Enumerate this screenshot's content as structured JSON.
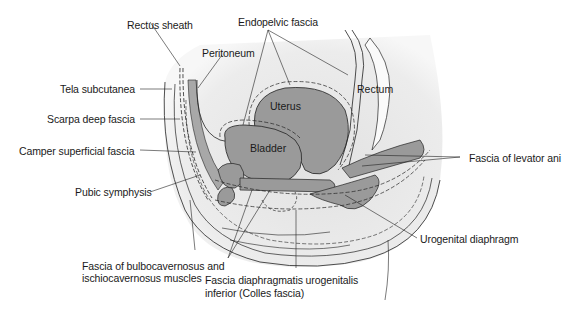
{
  "figure": {
    "colors": {
      "background": "#ffffff",
      "body_tint": "#e8e8e8",
      "organ_fill": "#9a9a9a",
      "line": "#1a1a1a"
    }
  },
  "organs": {
    "uterus": "Uterus",
    "bladder": "Bladder",
    "rectum": "Rectum"
  },
  "labels": {
    "rectus_sheath": "Rectus sheath",
    "endopelvic_fascia": "Endopelvic fascia",
    "peritoneum": "Peritoneum",
    "tela_subcutanea": "Tela subcutanea",
    "scarpa": "Scarpa deep fascia",
    "camper": "Camper superficial fascia",
    "pubic_symphysis": "Pubic symphysis",
    "levator_ani": "Fascia of levator ani",
    "urogenital_diaphragm": "Urogenital diaphragm",
    "bulbo_line1": "Fascia of bulbocavernosus and",
    "bulbo_line2": "ischiocavernosus muscles",
    "colles_line1": "Fascia diaphragmatis urogenitalis",
    "colles_line2": "inferior (Colles fascia)"
  }
}
